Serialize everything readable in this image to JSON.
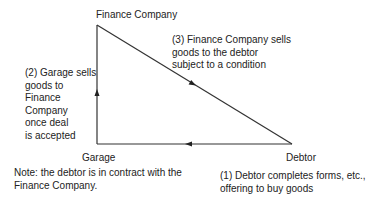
{
  "nodes": {
    "finance_company": "Finance Company",
    "garage": "Garage",
    "debtor": "Debtor"
  },
  "steps": {
    "step1": [
      "(1) Debtor completes forms, etc.,",
      "offering to buy goods"
    ],
    "step2": [
      "(2) Garage sells",
      "goods to",
      "Finance",
      "Company",
      "once deal",
      "is accepted"
    ],
    "step3": [
      "(3) Finance Company sells",
      "goods to the debtor",
      "subject to a condition"
    ]
  },
  "note": [
    "Note: the debtor is in contract with the",
    "Finance Company."
  ]
}
